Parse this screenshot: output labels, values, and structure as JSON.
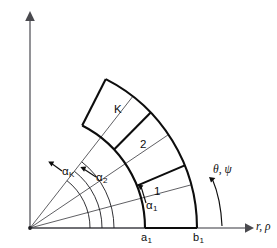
{
  "figure": {
    "kind": "polar-sector-mesh-diagram",
    "background_color": "#ffffff",
    "line_color": "#0d0d0d",
    "axis_color": "#77777c",
    "width": 277,
    "height": 248
  },
  "axes": {
    "origin": {
      "x": 30,
      "y": 228
    },
    "horizontal": {
      "name": "radial-axis",
      "label": "r, ρ",
      "label_symbols": [
        "r",
        "ρ"
      ],
      "arrow_x": 252,
      "y": 228
    },
    "vertical": {
      "name": "vertical-axis",
      "x": 30,
      "top_y": 12
    },
    "angular": {
      "name": "angular-axis",
      "label": "θ, ψ",
      "label_symbols": [
        "θ",
        "ψ"
      ]
    }
  },
  "ticks": [
    {
      "name": "inner-radius-tick",
      "label": "a",
      "subscript": "1",
      "x": 145
    },
    {
      "name": "outer-radius-tick",
      "label": "b",
      "subscript": "1",
      "x": 197
    }
  ],
  "angles": [
    {
      "name": "alpha-1",
      "label": "α",
      "subscript": "1",
      "degrees": 15
    },
    {
      "name": "alpha-2",
      "label": "α",
      "subscript": "2",
      "degrees": 34
    },
    {
      "name": "alpha-K",
      "label": "α",
      "subscript": "K",
      "degrees": 52
    }
  ],
  "cells": [
    {
      "name": "cell-1",
      "label": "1"
    },
    {
      "name": "cell-2",
      "label": "2"
    },
    {
      "name": "cell-K",
      "label": "K"
    }
  ],
  "geometry": {
    "inner_radius": 115,
    "outer_radius": 167,
    "sector_start_deg": 0,
    "sector_end_deg": 63,
    "cell_boundaries_deg": [
      0,
      22,
      43,
      63
    ],
    "guide_arc_radii": [
      60,
      72,
      84
    ]
  }
}
